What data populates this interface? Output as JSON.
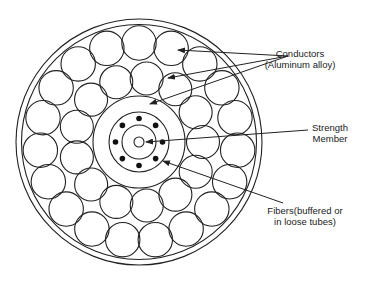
{
  "colors": {
    "stroke": "#222222",
    "background": "#ffffff",
    "fiber_dot": "#111111"
  },
  "components": {
    "outer_sheath_rings": 2,
    "outer_conductor_layer_count": 19,
    "inner_conductor_layer_count": 13,
    "fiber_count": 8
  },
  "labels": {
    "conductors": {
      "line1": "Conductors",
      "line2": "(Aluminum alloy)"
    },
    "strength_member": {
      "line1": "Strength",
      "line2": "Member"
    },
    "fibers": {
      "line1": "Fibers(buffered or",
      "line2": "in loose tubes)"
    }
  }
}
